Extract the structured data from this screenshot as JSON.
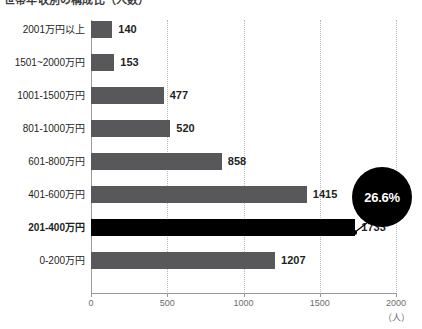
{
  "chart_data": {
    "type": "bar",
    "orientation": "horizontal",
    "title": "世帯年収別の構成比（人数）",
    "xlabel": "（人）",
    "ylabel": "",
    "xlim": [
      0,
      2000
    ],
    "xticks": [
      0,
      500,
      1000,
      1500,
      2000
    ],
    "xtick_labels": [
      "0",
      "500",
      "1000",
      "1500",
      "2000"
    ],
    "grid": true,
    "legend": false,
    "categories": [
      "2001万円以上",
      "1501~2000万円",
      "1001-1500万円",
      "801-1000万円",
      "601-800万円",
      "401-600万円",
      "201-400万円",
      "0-200万円"
    ],
    "values": [
      140,
      153,
      477,
      520,
      858,
      1415,
      1733,
      1207
    ],
    "value_labels": [
      "140",
      "153",
      "477",
      "520",
      "858",
      "1415",
      "1733",
      "1207"
    ],
    "highlight_index": 6,
    "annotations": [
      {
        "text": "26.6%",
        "target_category": "201-400万円",
        "target_value": 1733,
        "style": "black-circle-badge"
      }
    ],
    "colors": {
      "bar": "#58585a",
      "bar_highlight": "#000000",
      "badge_background": "#000000",
      "badge_text": "#ffffff",
      "grid": "#b9b9b9",
      "axis": "#9a9a9a",
      "text": "#231f20",
      "tick_text": "#6d6d6d",
      "background": "#ffffff"
    }
  }
}
